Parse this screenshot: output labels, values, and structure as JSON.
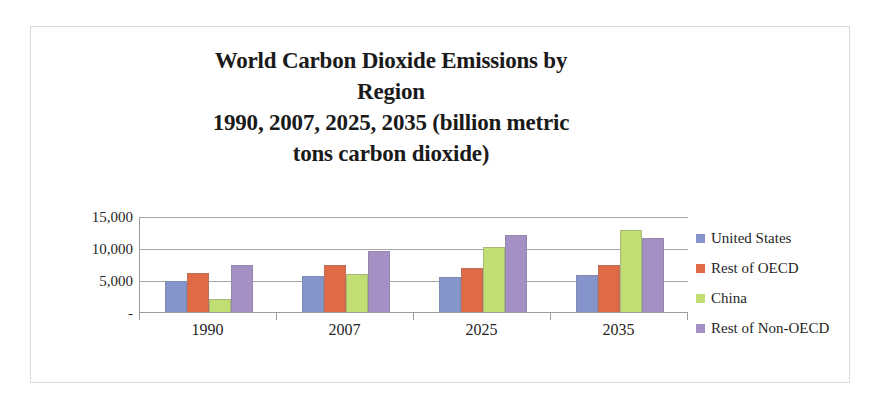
{
  "chart_data": {
    "type": "bar",
    "title": "World Carbon Dioxide Emissions by Region\n1990, 2007, 2025, 2035 (billion metric tons carbon dioxide)",
    "title_lines": [
      "World Carbon Dioxide Emissions by",
      "Region",
      "1990, 2007, 2025, 2035 (billion metric",
      "tons carbon dioxide)"
    ],
    "xlabel": "",
    "ylabel": "",
    "categories": [
      "1990",
      "2007",
      "2025",
      "2035"
    ],
    "series": [
      {
        "name": "United States",
        "color": "#8595cb",
        "values": [
          5000,
          5800,
          5600,
          5900
        ]
      },
      {
        "name": "Rest of OECD",
        "color": "#df6a45",
        "values": [
          6300,
          7500,
          7100,
          7500
        ]
      },
      {
        "name": "China",
        "color": "#c0de72",
        "values": [
          2200,
          6100,
          10300,
          13000
        ]
      },
      {
        "name": "Rest of Non-OECD",
        "color": "#a490c4",
        "values": [
          7500,
          9700,
          12200,
          11700
        ]
      }
    ],
    "ylim": [
      0,
      15000
    ],
    "yticks": [
      0,
      5000,
      10000,
      15000
    ],
    "ytick_labels": [
      "-",
      "5,000",
      "10,000",
      "15,000"
    ],
    "grid": true,
    "legend_position": "right",
    "legend_entries": [
      "United States",
      "Rest of OECD",
      "China",
      "Rest of Non-OECD"
    ]
  }
}
